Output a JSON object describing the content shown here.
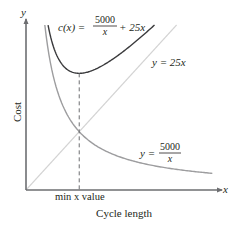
{
  "chart_data": {
    "type": "line",
    "title": "",
    "xlabel": "Cycle length",
    "ylabel": "Cost",
    "x_axis_symbol": "x",
    "y_axis_symbol": "y",
    "xlim": [
      0,
      51
    ],
    "ylim": [
      0,
      1000
    ],
    "grid": false,
    "legend": "none",
    "series": [
      {
        "name": "c(x) = 5000/x + 25x",
        "formula": "5000/x + 25*x",
        "coef_a": 5000,
        "coef_b": 25,
        "color": "#3a3a3c",
        "x_range": [
          5.86,
          34.14
        ]
      },
      {
        "name": "y = 25x",
        "formula": "25*x",
        "slope": 25,
        "color": "#d4d4d4",
        "x_range": [
          0,
          40
        ]
      },
      {
        "name": "y = 5000/x",
        "formula": "5000/x",
        "numerator": 5000,
        "color": "#9d9d9f",
        "x_range": [
          5.0,
          49.5
        ]
      }
    ],
    "annotations": [
      {
        "type": "vertical-dashed-line",
        "x": 14.14,
        "y_top": 707.1,
        "label": "min x value"
      }
    ],
    "labels": {
      "cost_curve": {
        "lhs": "c(x) =",
        "num": "5000",
        "den": "x",
        "rhs": "+ 25x"
      },
      "linear": "y = 25x",
      "reciprocal": {
        "lhs": "y =",
        "num": "5000",
        "den": "x"
      }
    }
  }
}
